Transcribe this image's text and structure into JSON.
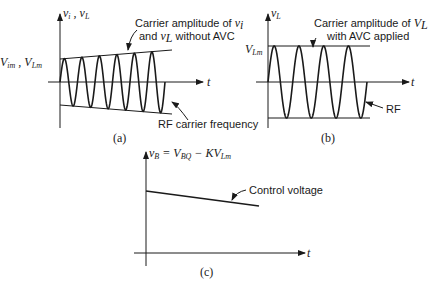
{
  "panels": {
    "a": {
      "caption": "(a)",
      "y_axis_label": "v_i , v_L",
      "x_axis_label": "t",
      "amplitude_label": "V_im , V_Lm",
      "annotation_envelope_line1": "Carrier amplitude of v_i",
      "annotation_envelope_line2": "and v_L  without AVC",
      "annotation_carrier": "RF carrier frequency",
      "cycles": 6,
      "envelope": "growing"
    },
    "b": {
      "caption": "(b)",
      "y_axis_label": "v_L",
      "x_axis_label": "t",
      "amplitude_label": "V_Lm",
      "annotation_envelope_line1": "Carrier amplitude of V_L",
      "annotation_envelope_line2": "with AVC applied",
      "annotation_carrier": "RF",
      "cycles": 4,
      "envelope": "constant"
    },
    "c": {
      "caption": "(c)",
      "y_axis_label": "v_B = V_BQ  − KV_Lm",
      "x_axis_label": "t",
      "annotation_line": "Control voltage",
      "trend": "decreasing"
    }
  },
  "text": {
    "a_ylabel_v": "v",
    "a_ylabel_i": "i",
    "a_ylabel_sep": " , v",
    "a_ylabel_L": "L",
    "a_amp_V1": "V",
    "a_amp_im": "im",
    "a_amp_sep": " , V",
    "a_amp_Lm": "Lm",
    "a_t": "t",
    "a_note1_text": "Carrier amplitude of ",
    "a_note1_v": "v",
    "a_note1_i": "i",
    "a_note2_pre": "and ",
    "a_note2_v": "v",
    "a_note2_L": "L",
    "a_note2_post": "  without AVC",
    "a_rf": "RF carrier frequency",
    "a_cap": "(a)",
    "b_ylabel_v": "v",
    "b_ylabel_L": "L",
    "b_amp_V": "V",
    "b_amp_Lm": "Lm",
    "b_t": "t",
    "b_note1_text": "Carrier amplitude of ",
    "b_note1_V": "V",
    "b_note1_L": "L",
    "b_note2": "with AVC applied",
    "b_rf": "RF",
    "b_cap": "(b)",
    "c_v": "v",
    "c_B": "B",
    "c_eq": " = V",
    "c_BQ": "BQ",
    "c_minus": "  − KV",
    "c_Lm": "Lm",
    "c_note": "Control voltage",
    "c_t": "t",
    "c_cap": "(c)"
  }
}
